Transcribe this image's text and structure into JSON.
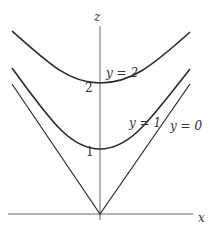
{
  "diagram": {
    "axes": {
      "z_label": "z",
      "x_label": "x"
    },
    "ticks": {
      "z1": "1",
      "z2": "2"
    },
    "curves": [
      {
        "id": "y2",
        "label": "y = 2",
        "vertex_z": 2
      },
      {
        "id": "y1",
        "label": "y = 1",
        "vertex_z": 1
      },
      {
        "id": "y0",
        "label": "y = 0",
        "vertex_z": 0
      }
    ],
    "colors": {
      "curve": "#2a2a2a",
      "axis": "#555555",
      "text": "#333333"
    }
  }
}
